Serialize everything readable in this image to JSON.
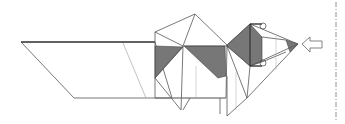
{
  "diagram": {
    "type": "origami-fold-diagram",
    "colors": {
      "line": "#555555",
      "shade": "#777777",
      "background": "#ffffff"
    },
    "arrow": {
      "direction": "left",
      "label": "push-arrow"
    },
    "divider": {
      "style": "dash-dot"
    }
  }
}
